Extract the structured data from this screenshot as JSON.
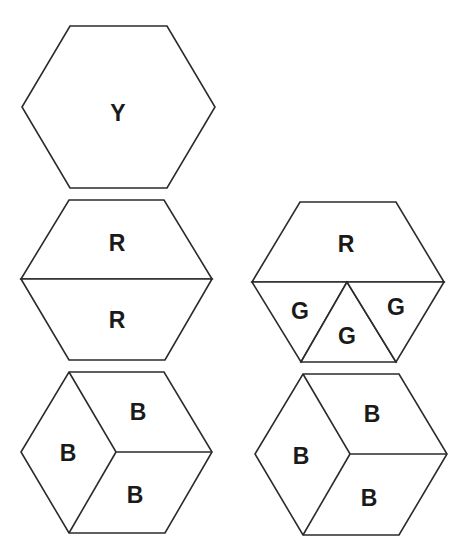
{
  "diagram": {
    "title": "",
    "stroke_color": "#2b2b2b",
    "label_color": "#1a1a1a",
    "background": "#ffffff",
    "shapes": [
      {
        "id": "hex-yellow",
        "name": "single yellow hexagon",
        "pieces": [
          {
            "type": "hexagon",
            "label": "Y"
          }
        ]
      },
      {
        "id": "hex-two-red",
        "name": "hexagon split into two red trapezoids",
        "pieces": [
          {
            "type": "trapezoid-top",
            "label": "R"
          },
          {
            "type": "trapezoid-bottom",
            "label": "R"
          }
        ]
      },
      {
        "id": "hex-red-green",
        "name": "hexagon split into red trapezoid and three green triangles",
        "pieces": [
          {
            "type": "trapezoid-top",
            "label": "R"
          },
          {
            "type": "triangle-left",
            "label": "G"
          },
          {
            "type": "triangle-middle",
            "label": "G"
          },
          {
            "type": "triangle-right",
            "label": "G"
          }
        ]
      },
      {
        "id": "hex-blue-left",
        "name": "hexagon split into three blue rhombi",
        "pieces": [
          {
            "type": "rhombus-left",
            "label": "B"
          },
          {
            "type": "rhombus-top-right",
            "label": "B"
          },
          {
            "type": "rhombus-bottom-right",
            "label": "B"
          }
        ]
      },
      {
        "id": "hex-blue-right",
        "name": "hexagon split into three blue rhombi",
        "pieces": [
          {
            "type": "rhombus-left",
            "label": "B"
          },
          {
            "type": "rhombus-top-right",
            "label": "B"
          },
          {
            "type": "rhombus-bottom-right",
            "label": "B"
          }
        ]
      }
    ]
  }
}
